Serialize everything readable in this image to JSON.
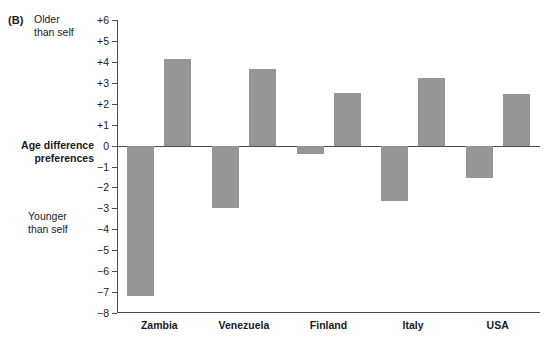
{
  "panel": {
    "letter": "(B)"
  },
  "annotations": {
    "older_than_self": "Older\nthan self",
    "younger_than_self": "Younger\nthan self",
    "axis_title": "Age difference\npreferences"
  },
  "colors": {
    "bar": "#969696",
    "axis": "#4d4d4d",
    "text": "#1a1a1a",
    "background": "#ffffff"
  },
  "chart_data": {
    "type": "bar",
    "title": "",
    "xlabel": "",
    "ylabel": "Age difference preferences",
    "ylim": [
      -8,
      6
    ],
    "yticks": [
      6,
      5,
      4,
      3,
      2,
      1,
      0,
      -1,
      -2,
      -3,
      -4,
      -5,
      -6,
      -7,
      -8
    ],
    "ytick_labels": [
      "+6",
      "+5",
      "+4",
      "+3",
      "+2",
      "+1",
      "0",
      "−1",
      "−2",
      "−3",
      "−4",
      "−5",
      "−6",
      "−7",
      "−8"
    ],
    "grid": false,
    "legend": false,
    "categories": [
      "Zambia",
      "Venezuela",
      "Finland",
      "Italy",
      "USA"
    ],
    "series": [
      {
        "name": "Younger than self",
        "values": [
          -7.2,
          -3.0,
          -0.4,
          -2.65,
          -1.55
        ]
      },
      {
        "name": "Older than self",
        "values": [
          4.15,
          3.65,
          2.5,
          3.25,
          2.45
        ]
      }
    ]
  }
}
